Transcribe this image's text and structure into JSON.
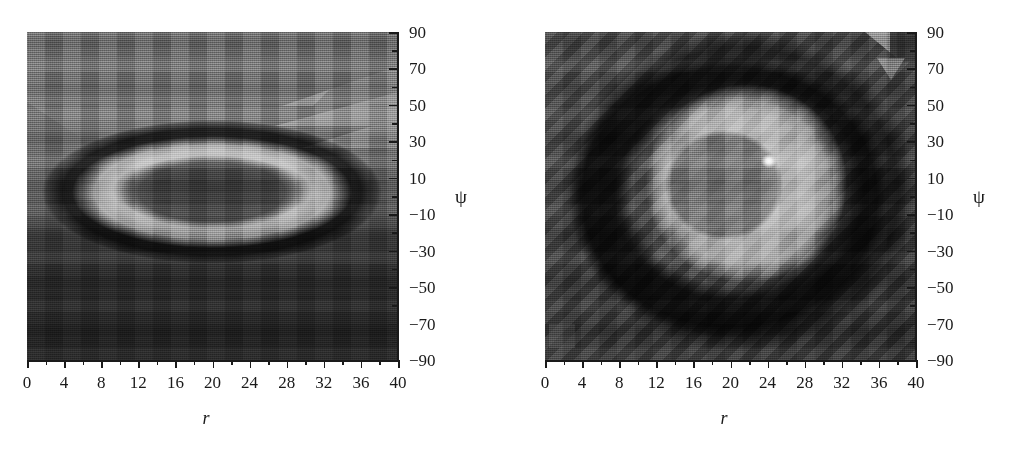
{
  "figure": {
    "type": "two-panel density plot",
    "panels": [
      {
        "id": "left",
        "name": "left-density-plot",
        "xlabel": "r",
        "ylabel": "ψ",
        "x_ticks": [
          "0",
          "4",
          "8",
          "12",
          "16",
          "20",
          "24",
          "28",
          "32",
          "36",
          "40"
        ],
        "y_ticks": [
          "90",
          "70",
          "50",
          "30",
          "10",
          "−10",
          "−30",
          "−50",
          "−70",
          "−90"
        ],
        "xlim": [
          0,
          40
        ],
        "ylim": [
          -90,
          90
        ],
        "x_minor_step": 2,
        "y_minor_step": 10,
        "feature": "horizontally elongated elliptical ring centred near r=20, psi=5",
        "colormap": "grayscale"
      },
      {
        "id": "right",
        "name": "right-density-plot",
        "xlabel": "r",
        "ylabel": "ψ",
        "x_ticks": [
          "0",
          "4",
          "8",
          "12",
          "16",
          "20",
          "24",
          "28",
          "32",
          "36",
          "40"
        ],
        "y_ticks": [
          "90",
          "70",
          "50",
          "30",
          "10",
          "−10",
          "−30",
          "−50",
          "−70",
          "−90"
        ],
        "xlim": [
          0,
          40
        ],
        "ylim": [
          -90,
          90
        ],
        "x_minor_step": 2,
        "y_minor_step": 10,
        "feature": "concentric rounded-square bright region with dark inner disc near r=21, psi=5 and a bright point at r=23, psi=18",
        "colormap": "grayscale"
      }
    ]
  },
  "chart_data": {
    "type": "heatmap",
    "title": "",
    "xlabel": "r",
    "ylabel": "ψ",
    "xlim": [
      0,
      40
    ],
    "ylim": [
      -90,
      90
    ],
    "xticks": [
      0,
      4,
      8,
      12,
      16,
      20,
      24,
      28,
      32,
      36,
      40
    ],
    "yticks": [
      90,
      70,
      50,
      30,
      10,
      -10,
      -30,
      -50,
      -70,
      -90
    ],
    "grid": false,
    "legend": "none",
    "colormap": "grayscale",
    "panels": [
      {
        "name": "left",
        "description": "Elliptical ring / island structure elongated along r. A dark annulus encloses a bright elliptical band, which in turn encloses a mid-gray core. Background is mid-gray at top, fading dark toward bottom.",
        "regions": [
          {
            "label": "upper background",
            "center_r": 20,
            "center_psi": 60,
            "gray": 0.42
          },
          {
            "label": "outer dark annulus",
            "center_r": 20,
            "center_psi": 5,
            "semi_r": 17.5,
            "semi_psi": 36,
            "gray": 0.17
          },
          {
            "label": "bright elliptical band",
            "center_r": 20,
            "center_psi": 5,
            "semi_r": 14.0,
            "semi_psi": 26,
            "gray": 0.62
          },
          {
            "label": "inner mid-gray core",
            "center_r": 20,
            "center_psi": 3,
            "semi_r": 10.0,
            "semi_psi": 16,
            "gray": 0.38
          },
          {
            "label": "lower background",
            "center_r": 20,
            "center_psi": -60,
            "gray": 0.22
          }
        ],
        "artifacts": [
          "bright triangular mesh facets upper-right near r=30-40, psi=40-70"
        ]
      },
      {
        "name": "right",
        "description": "Concentric rounded-square (superellipse) structure. Dark background frames a dark rounded-square annulus, inside which is a large bright rounded-square plateau containing a darker inner disc. A small white point sits at the upper right of the inner disc.",
        "regions": [
          {
            "label": "background corners",
            "center_r": 3,
            "center_psi": 80,
            "gray": 0.3
          },
          {
            "label": "dark rounded-square annulus",
            "center_r": 21,
            "center_psi": 3,
            "semi_r": 19,
            "semi_psi": 82,
            "gray": 0.15
          },
          {
            "label": "bright rounded-square plateau",
            "center_r": 21,
            "center_psi": 4,
            "semi_r": 14,
            "semi_psi": 58,
            "gray": 0.6
          },
          {
            "label": "inner dark disc",
            "center_r": 21,
            "center_psi": 3,
            "semi_r": 6.5,
            "semi_psi": 26,
            "gray": 0.38
          },
          {
            "label": "bright point",
            "r": 23,
            "psi": 18,
            "gray": 0.97
          }
        ],
        "artifacts": [
          "bright triangular mesh facets top-right corner",
          "light square patch bottom-left near r=2, psi=-82"
        ]
      }
    ]
  }
}
